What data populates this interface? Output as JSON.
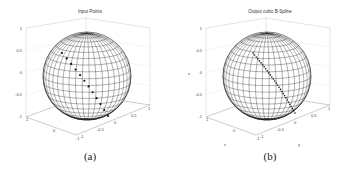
{
  "figure": {
    "panels": [
      {
        "id": "a",
        "title": "Input Points",
        "caption": "(a)",
        "zlabel": "",
        "xlabel": "",
        "ylabel": "",
        "z_ticks": [
          "1",
          "0.5",
          "0",
          "-0.5",
          "-1"
        ],
        "x_ticks": [
          "1",
          "0",
          "-1"
        ],
        "y_ticks": [
          "-1",
          "-0.5",
          "0",
          "0.5",
          "1"
        ]
      },
      {
        "id": "b",
        "title": "Output cubic B-Spline",
        "caption": "(b)",
        "zlabel": "z",
        "xlabel": "x",
        "ylabel": "y",
        "z_ticks": [
          "1",
          "0.5",
          "0",
          "-0.5",
          "-1"
        ],
        "x_ticks": [
          "1",
          "0",
          "-1"
        ],
        "y_ticks": [
          "-1",
          "-0.5",
          "0",
          "0.5",
          "1"
        ]
      }
    ]
  },
  "chart_data": [
    {
      "type": "scatter",
      "title": "Input Points",
      "subfigure": "(a)",
      "description": "3D wireframe unit sphere with discrete input points along a great-circle arc",
      "axes": {
        "x": [
          -1,
          1
        ],
        "y": [
          -1,
          1
        ],
        "z": [
          -1,
          1
        ]
      },
      "z_ticks": [
        1,
        0.5,
        0,
        -0.5,
        -1
      ],
      "x_ticks": [
        1,
        0,
        -1
      ],
      "y_ticks": [
        -1,
        -0.5,
        0,
        0.5,
        1
      ],
      "grid": true,
      "points_count": 12
    },
    {
      "type": "line",
      "title": "Output cubic B-Spline",
      "subfigure": "(b)",
      "description": "3D wireframe unit sphere with dense cubic B-spline curve along a great-circle arc",
      "axes": {
        "x": [
          -1,
          1
        ],
        "y": [
          -1,
          1
        ],
        "z": [
          -1,
          1
        ]
      },
      "xlabel": "x",
      "ylabel": "y",
      "zlabel": "z",
      "z_ticks": [
        1,
        0.5,
        0,
        -0.5,
        -1
      ],
      "x_ticks": [
        1,
        0,
        -1
      ],
      "y_ticks": [
        -1,
        -0.5,
        0,
        0.5,
        1
      ],
      "grid": true,
      "points_count": 30
    }
  ]
}
